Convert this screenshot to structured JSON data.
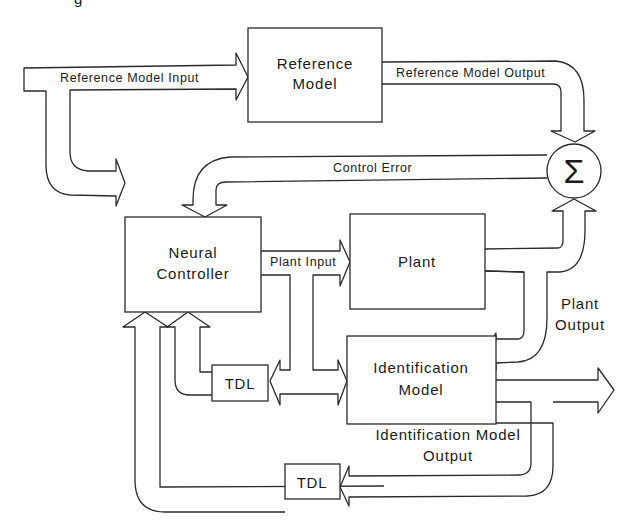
{
  "diagram": {
    "type": "block-diagram",
    "title_fragment": "g",
    "blocks": {
      "reference_model": {
        "line1": "Reference",
        "line2": "Model"
      },
      "neural_controller": {
        "line1": "Neural",
        "line2": "Controller"
      },
      "plant": {
        "label": "Plant"
      },
      "identification_model": {
        "line1": "Identification",
        "line2": "Model"
      },
      "tdl_upper": {
        "label": "TDL"
      },
      "tdl_lower": {
        "label": "TDL"
      },
      "summing_junction": {
        "symbol": "Σ"
      }
    },
    "signals": {
      "reference_model_input": "Reference Model Input",
      "reference_model_output": "Reference Model Output",
      "control_error": "Control Error",
      "plant_input": "Plant Input",
      "plant_output_line1": "Plant",
      "plant_output_line2": "Output",
      "id_model_output_line1": "Identification Model",
      "id_model_output_line2": "Output"
    },
    "colors": {
      "stroke": "#2a2a2a",
      "background": "#ffffff"
    }
  }
}
